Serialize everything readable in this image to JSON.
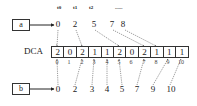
{
  "diagram": {
    "time_labels": [
      "t0",
      "t1",
      "t2",
      "......"
    ],
    "pointer_a": {
      "label": "a",
      "values": [
        "0",
        "2",
        "5",
        "7",
        "8"
      ]
    },
    "array": {
      "label": "DCA",
      "cells": [
        "2",
        "0",
        "2",
        "1",
        "1",
        "2",
        "0",
        "2",
        "1",
        "1",
        "1"
      ],
      "indices": [
        "0",
        "1",
        "2",
        "3",
        "4",
        "5",
        "6",
        "7",
        "8",
        "9",
        "10"
      ]
    },
    "pointer_b": {
      "label": "b",
      "values": [
        "0",
        "2",
        "3",
        "4",
        "5",
        "7",
        "9",
        "10"
      ]
    }
  }
}
